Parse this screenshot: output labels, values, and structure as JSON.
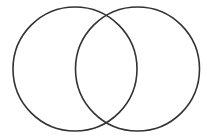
{
  "diagram": {
    "type": "venn",
    "background": "#ffffff",
    "stroke_color": "#333333",
    "stroke_width": 1.6,
    "sets": [
      {
        "name": "left-set",
        "label": "",
        "cx": 75,
        "cy": 69,
        "r": 62
      },
      {
        "name": "right-set",
        "label": "",
        "cx": 137.5,
        "cy": 69,
        "r": 62
      }
    ]
  }
}
